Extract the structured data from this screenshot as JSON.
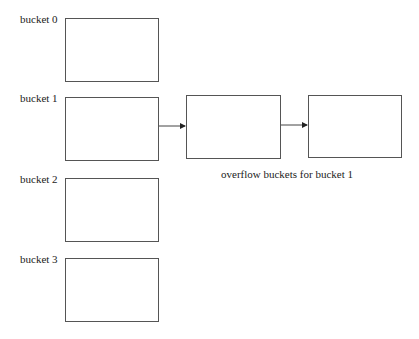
{
  "diagram": {
    "buckets": [
      {
        "label": "bucket 0"
      },
      {
        "label": "bucket 1"
      },
      {
        "label": "bucket 2"
      },
      {
        "label": "bucket 3"
      }
    ],
    "overflow_buckets": [
      {
        "for_bucket": 1
      },
      {
        "for_bucket": 1
      }
    ],
    "overflow_caption": "overflow  buckets for bucket 1",
    "colors": {
      "line": "#555555",
      "text": "#222222",
      "background": "#ffffff"
    }
  }
}
